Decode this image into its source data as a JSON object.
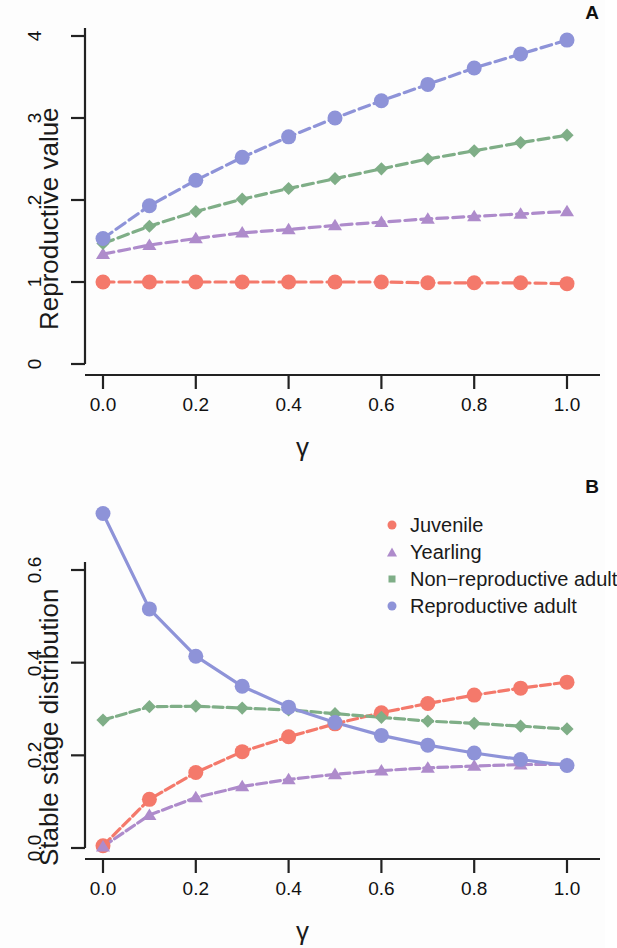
{
  "figure": {
    "panel_a_letter": "A",
    "panel_b_letter": "B",
    "gamma_symbol": "γ"
  },
  "colors": {
    "juvenile": "#F4796B",
    "yearling": "#AE8BCB",
    "non_reproductive_adult": "#7FAE87",
    "reproductive_adult": "#8E93D8"
  },
  "legend": {
    "items": [
      {
        "label": "Juvenile",
        "marker": "circle",
        "color": "#F4796B"
      },
      {
        "label": "Yearling",
        "marker": "triangle",
        "color": "#AE8BCB"
      },
      {
        "label": "Non−reproductive adult",
        "marker": "diamond",
        "color": "#7FAE87"
      },
      {
        "label": "Reproductive adult",
        "marker": "circle",
        "color": "#8E93D8"
      }
    ]
  },
  "chart_data": [
    {
      "id": "panel_a",
      "type": "line",
      "title": "A",
      "xlabel": "γ",
      "ylabel": "Reproductive value",
      "x": [
        0.0,
        0.1,
        0.2,
        0.3,
        0.4,
        0.5,
        0.6,
        0.7,
        0.8,
        0.9,
        1.0
      ],
      "xlim": [
        -0.04,
        1.04
      ],
      "ylim": [
        0,
        4.1
      ],
      "xticks": [
        0.0,
        0.2,
        0.4,
        0.6,
        0.8,
        1.0
      ],
      "xtick_labels": [
        "0.0",
        "0.2",
        "0.4",
        "0.6",
        "0.8",
        "1.0"
      ],
      "yticks": [
        0,
        1,
        2,
        3,
        4
      ],
      "ytick_labels": [
        "0",
        "1",
        "2",
        "3",
        "4"
      ],
      "grid": false,
      "legend_position": "none",
      "series": [
        {
          "name": "Juvenile",
          "marker": "circle",
          "color": "#F4796B",
          "values": [
            1.0,
            1.0,
            1.0,
            1.0,
            1.0,
            1.0,
            1.0,
            0.99,
            0.99,
            0.99,
            0.98
          ]
        },
        {
          "name": "Yearling",
          "marker": "triangle",
          "color": "#AE8BCB",
          "values": [
            1.34,
            1.45,
            1.53,
            1.6,
            1.64,
            1.69,
            1.73,
            1.77,
            1.8,
            1.83,
            1.86
          ]
        },
        {
          "name": "Non−reproductive adult",
          "marker": "diamond",
          "color": "#7FAE87",
          "values": [
            1.47,
            1.68,
            1.86,
            2.01,
            2.14,
            2.26,
            2.38,
            2.5,
            2.6,
            2.7,
            2.79
          ]
        },
        {
          "name": "Reproductive adult",
          "marker": "circle",
          "color": "#8E93D8",
          "values": [
            1.53,
            1.93,
            2.24,
            2.52,
            2.77,
            3.0,
            3.21,
            3.41,
            3.61,
            3.78,
            3.95
          ]
        }
      ]
    },
    {
      "id": "panel_b",
      "type": "line",
      "title": "B",
      "xlabel": "γ",
      "ylabel": "Stable stage distribution",
      "x": [
        0.0,
        0.1,
        0.2,
        0.3,
        0.4,
        0.5,
        0.6,
        0.7,
        0.8,
        0.9,
        1.0
      ],
      "xlim": [
        -0.04,
        1.04
      ],
      "ylim": [
        -0.01,
        0.75
      ],
      "xticks": [
        0.0,
        0.2,
        0.4,
        0.6,
        0.8,
        1.0
      ],
      "xtick_labels": [
        "0.0",
        "0.2",
        "0.4",
        "0.6",
        "0.8",
        "1.0"
      ],
      "yticks": [
        0.0,
        0.2,
        0.4,
        0.6
      ],
      "ytick_labels": [
        "0.0",
        "0.2",
        "0.4",
        "0.6"
      ],
      "grid": false,
      "legend_position": "top-right",
      "series": [
        {
          "name": "Juvenile",
          "marker": "circle",
          "color": "#F4796B",
          "values": [
            0.005,
            0.105,
            0.163,
            0.208,
            0.24,
            0.268,
            0.292,
            0.312,
            0.33,
            0.345,
            0.358
          ]
        },
        {
          "name": "Yearling",
          "marker": "triangle",
          "color": "#AE8BCB",
          "values": [
            0.003,
            0.071,
            0.109,
            0.133,
            0.148,
            0.159,
            0.167,
            0.173,
            0.177,
            0.18,
            0.181
          ]
        },
        {
          "name": "Non−reproductive adult",
          "marker": "diamond",
          "color": "#7FAE87",
          "values": [
            0.276,
            0.305,
            0.306,
            0.302,
            0.298,
            0.29,
            0.282,
            0.274,
            0.269,
            0.263,
            0.257
          ]
        },
        {
          "name": "Reproductive adult",
          "marker": "circle",
          "color": "#8E93D8",
          "values": [
            0.722,
            0.516,
            0.414,
            0.349,
            0.304,
            0.271,
            0.243,
            0.222,
            0.205,
            0.191,
            0.178
          ]
        }
      ]
    }
  ]
}
